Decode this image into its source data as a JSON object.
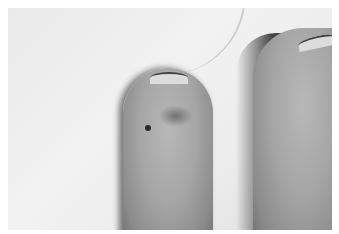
{
  "image": {
    "description": "Black-and-white clinical photograph of two fingertips against a white cloth background; the left fingertip shows a small dark spot and faint bruising near the tip.",
    "subjects": [
      "left fingertip with dark lesion",
      "right fingertip",
      "white fabric background"
    ],
    "colors": {
      "background": "#ececec",
      "skin": "#a5a5a5",
      "shadow": "#333333",
      "lesion": "#2a2a2a"
    }
  }
}
